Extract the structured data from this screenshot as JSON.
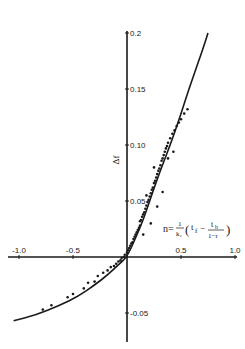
{
  "chart_data": {
    "type": "scatter",
    "title": "",
    "xlabel": "",
    "ylabel": "Δf",
    "xlim": [
      -1.0,
      1.0
    ],
    "ylim": [
      -0.06,
      0.2
    ],
    "grid": false,
    "legend": null,
    "x_ticks": [
      {
        "value": -1.0,
        "label": "-1.0"
      },
      {
        "value": -0.5,
        "label": "-0.5"
      },
      {
        "value": 0.5,
        "label": "0.5"
      },
      {
        "value": 1.0,
        "label": "1.0"
      }
    ],
    "y_ticks": [
      {
        "value": 0.2,
        "label": "0.2"
      },
      {
        "value": 0.15,
        "label": "0.15"
      },
      {
        "value": 0.1,
        "label": "0.10"
      },
      {
        "value": 0.05,
        "label": "0.05"
      },
      {
        "value": -0.05,
        "label": "-0.05"
      }
    ],
    "annotation": {
      "lhs": "n=",
      "frac_num": "1",
      "frac_den": "k₂",
      "term1": "t",
      "term1_sub": "f",
      "minus": "−",
      "frac2_num": "t",
      "frac2_num_sub": "b",
      "frac2_den": "1−r",
      "open_paren": "(",
      "close_paren": ")"
    },
    "series": [
      {
        "name": "fitted curve",
        "kind": "line",
        "x": [
          -1.05,
          -0.85,
          -0.62,
          -0.45,
          -0.3,
          -0.18,
          -0.08,
          0.0,
          0.08,
          0.15,
          0.21,
          0.3,
          0.4,
          0.48,
          0.54,
          0.62,
          0.7,
          0.75
        ],
        "y": [
          -0.057,
          -0.052,
          -0.043,
          -0.035,
          -0.025,
          -0.016,
          -0.007,
          0.0,
          0.017,
          0.033,
          0.05,
          0.075,
          0.1,
          0.122,
          0.14,
          0.163,
          0.185,
          0.2
        ]
      },
      {
        "name": "observations",
        "kind": "scatter",
        "x": [
          -0.78,
          -0.7,
          -0.55,
          -0.5,
          -0.4,
          -0.36,
          -0.3,
          -0.27,
          -0.22,
          -0.18,
          -0.15,
          -0.12,
          -0.1,
          -0.08,
          -0.06,
          -0.05,
          -0.03,
          -0.02,
          0.0,
          0.01,
          0.02,
          0.03,
          0.04,
          0.05,
          0.06,
          0.07,
          0.08,
          0.09,
          0.1,
          0.11,
          0.12,
          0.12,
          0.13,
          0.14,
          0.15,
          0.16,
          0.17,
          0.18,
          0.19,
          0.2,
          0.21,
          0.22,
          0.23,
          0.24,
          0.25,
          0.26,
          0.27,
          0.28,
          0.29,
          0.3,
          0.31,
          0.32,
          0.33,
          0.34,
          0.35,
          0.36,
          0.37,
          0.38,
          0.4,
          0.42,
          0.44,
          0.46,
          0.48,
          0.5,
          0.53,
          0.56,
          0.15,
          0.22,
          0.28,
          0.33,
          0.18,
          0.25,
          0.38,
          0.43
        ],
        "y": [
          -0.047,
          -0.043,
          -0.036,
          -0.033,
          -0.028,
          -0.023,
          -0.022,
          -0.017,
          -0.014,
          -0.012,
          -0.009,
          -0.008,
          -0.006,
          -0.004,
          -0.003,
          -0.001,
          0.0,
          0.002,
          0.004,
          0.006,
          0.008,
          0.01,
          0.012,
          0.013,
          0.016,
          0.018,
          0.02,
          0.022,
          0.024,
          0.026,
          0.028,
          0.032,
          0.033,
          0.036,
          0.038,
          0.04,
          0.043,
          0.046,
          0.049,
          0.051,
          0.054,
          0.057,
          0.06,
          0.062,
          0.066,
          0.068,
          0.071,
          0.074,
          0.077,
          0.079,
          0.082,
          0.086,
          0.088,
          0.091,
          0.094,
          0.097,
          0.099,
          0.102,
          0.106,
          0.11,
          0.113,
          0.117,
          0.12,
          0.123,
          0.128,
          0.132,
          0.02,
          0.03,
          0.045,
          0.058,
          0.055,
          0.08,
          0.088,
          0.094
        ]
      }
    ]
  }
}
